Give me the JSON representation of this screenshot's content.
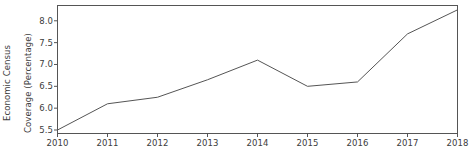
{
  "chart_data": {
    "type": "line",
    "title": "",
    "xlabel": "",
    "ylabel": "Economic Census Coverage (Percentage)",
    "ylabel_line1": "Economic Census",
    "ylabel_line2": "Coverage (Percentage)",
    "categories": [
      "2010",
      "2011",
      "2012",
      "2013",
      "2014",
      "2015",
      "2016",
      "2017",
      "2018"
    ],
    "x": [
      2010,
      2011,
      2012,
      2013,
      2014,
      2015,
      2016,
      2017,
      2018
    ],
    "values": [
      5.5,
      6.1,
      6.25,
      6.65,
      7.1,
      6.5,
      6.6,
      7.7,
      8.25
    ],
    "series": [
      {
        "name": "Economic Census Coverage",
        "values": [
          5.5,
          6.1,
          6.25,
          6.65,
          7.1,
          6.5,
          6.6,
          7.7,
          8.25
        ]
      }
    ],
    "xlim": [
      2010,
      2018
    ],
    "ylim": [
      5.42,
      8.35
    ],
    "yticks": [
      5.5,
      6.0,
      6.5,
      7.0,
      7.5,
      8.0
    ],
    "ytick_labels": [
      "5.5",
      "6.0",
      "6.5",
      "7.0",
      "7.5",
      "8.0"
    ],
    "xticks": [
      2010,
      2011,
      2012,
      2013,
      2014,
      2015,
      2016,
      2017,
      2018
    ],
    "xtick_labels": [
      "2010",
      "2011",
      "2012",
      "2013",
      "2014",
      "2015",
      "2016",
      "2017",
      "2018"
    ],
    "grid": false,
    "legend": false,
    "legend_position": "none",
    "line_color": "#555555",
    "axis_color": "#555555",
    "text_color": "#3c3c3c",
    "background": "#ffffff",
    "line_width": 1
  }
}
